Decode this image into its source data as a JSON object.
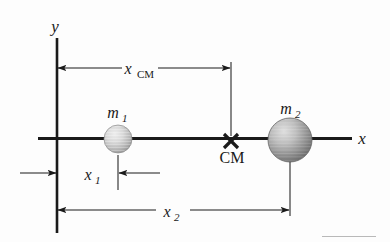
{
  "figure": {
    "type": "physics-diagram",
    "background_color": "#fdfdfd",
    "line_color": "#1a1a1a",
    "thin_line_color": "#4a4a4a",
    "axes": {
      "x_axis_label": "x",
      "y_axis_label": "y",
      "origin_label": ""
    },
    "masses": [
      {
        "id": "m1",
        "label": "m",
        "subscript": "1",
        "fill_light": "#e2e2e2",
        "fill_dark": "#9c9c9c",
        "radius": 14,
        "center_x": 118,
        "center_y": 139
      },
      {
        "id": "m2",
        "label": "m",
        "subscript": "2",
        "fill_light": "#cfcfcf",
        "fill_dark": "#6e6e6e",
        "radius": 22,
        "center_x": 290,
        "center_y": 140
      }
    ],
    "center_of_mass": {
      "marker": "×",
      "label": "CM",
      "x": 231,
      "y": 141
    },
    "dimensions": [
      {
        "id": "x_cm",
        "label": "x",
        "subscript": "CM",
        "subscript_style": "roman",
        "from_x": 58,
        "to_x": 231,
        "y": 68
      },
      {
        "id": "x_1",
        "label": "x",
        "subscript": "1",
        "subscript_style": "italic",
        "from_x": 57,
        "to_x": 118,
        "y": 173
      },
      {
        "id": "x_2",
        "label": "x",
        "subscript": "2",
        "subscript_style": "italic",
        "from_x": 58,
        "to_x": 290,
        "y": 210
      }
    ]
  }
}
